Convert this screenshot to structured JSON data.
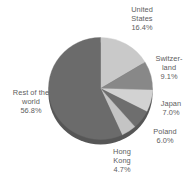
{
  "chart_data": {
    "type": "pie",
    "title": "",
    "subtitle": "",
    "xlabel": "",
    "ylabel": "",
    "legend_position": "none",
    "grid": false,
    "labels_outside": true,
    "start_angle_deg": 0,
    "direction": "clockwise",
    "categories": [
      "United States",
      "Switzerland",
      "Japan",
      "Poland",
      "Hong Kong",
      "Rest of the world"
    ],
    "values": [
      16.4,
      9.1,
      7.0,
      6.0,
      4.7,
      56.8
    ],
    "value_unit": "%",
    "colors": [
      "#c9c9c9",
      "#888888",
      "#d2d2d2",
      "#6e6e6e",
      "#c4c4c4",
      "#6b6b6b"
    ],
    "slices": [
      {
        "name": "United States",
        "value": 16.4,
        "label_text": "United\nStates\n16.4%",
        "value_text": "16.4%",
        "color": "#c9c9c9"
      },
      {
        "name": "Switzerland",
        "value": 9.1,
        "label_text": "Switzer-\nland\n9.1%",
        "value_text": "9.1%",
        "color": "#888888"
      },
      {
        "name": "Japan",
        "value": 7.0,
        "label_text": "Japan\n7.0%",
        "value_text": "7.0%",
        "color": "#d2d2d2"
      },
      {
        "name": "Poland",
        "value": 6.0,
        "label_text": "Poland\n6.0%",
        "value_text": "6.0%",
        "color": "#6e6e6e"
      },
      {
        "name": "Hong Kong",
        "value": 4.7,
        "label_text": "Hong\nKong\n4.7%",
        "value_text": "4.7%",
        "color": "#c4c4c4"
      },
      {
        "name": "Rest of the world",
        "value": 56.8,
        "label_text": "Rest of the\nworld\n56.8%",
        "value_text": "56.8%",
        "color": "#6b6b6b"
      }
    ]
  },
  "labels": {
    "united_states": "United\nStates\n16.4%",
    "switzerland": "Switzer-\nland\n9.1%",
    "japan": "Japan\n7.0%",
    "poland": "Poland\n6.0%",
    "hong_kong": "Hong\nKong\n4.7%",
    "rest_world": "Rest of the\nworld\n56.8%"
  }
}
